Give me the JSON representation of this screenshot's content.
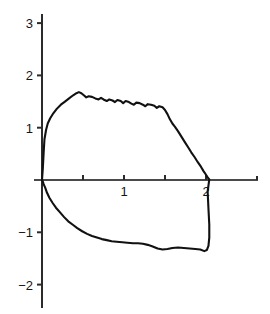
{
  "chart_data": {
    "type": "line",
    "title": "",
    "subtitle": "",
    "xlabel": "",
    "ylabel": "",
    "xlim": [
      -0.1,
      2.65
    ],
    "ylim": [
      -2.35,
      3.15
    ],
    "grid": false,
    "legend": null,
    "legend_position": "none",
    "axis_style": "crossed-axes-at-origin",
    "x_ticks": [
      0.5,
      1,
      1.5,
      2
    ],
    "x_tick_labels": [
      "",
      "1",
      "",
      "2"
    ],
    "y_ticks": [
      -2,
      -1,
      1,
      2,
      3
    ],
    "y_tick_labels": [
      "−2",
      "−1",
      "1",
      "2",
      "3"
    ],
    "annotations": [],
    "series": [
      {
        "name": "hysteresis-loop",
        "color": "#111111",
        "closed": true,
        "description": "Closed hysteresis loop: upper branch rises steeply from origin to a noisy plateau near 1.6, decays to zero near x=2; lower branch falls from origin to about -1.2, drifts to -1.35, then rises vertically at x=2.04 back to zero.",
        "points": [
          [
            0.0,
            0.0
          ],
          [
            0.01,
            0.22
          ],
          [
            0.02,
            0.52
          ],
          [
            0.03,
            0.78
          ],
          [
            0.05,
            0.96
          ],
          [
            0.07,
            1.08
          ],
          [
            0.1,
            1.18
          ],
          [
            0.14,
            1.28
          ],
          [
            0.18,
            1.36
          ],
          [
            0.23,
            1.44
          ],
          [
            0.28,
            1.5
          ],
          [
            0.33,
            1.56
          ],
          [
            0.38,
            1.62
          ],
          [
            0.42,
            1.66
          ],
          [
            0.45,
            1.68
          ],
          [
            0.48,
            1.66
          ],
          [
            0.51,
            1.62
          ],
          [
            0.54,
            1.58
          ],
          [
            0.57,
            1.6
          ],
          [
            0.61,
            1.59
          ],
          [
            0.65,
            1.56
          ],
          [
            0.69,
            1.54
          ],
          [
            0.72,
            1.57
          ],
          [
            0.75,
            1.54
          ],
          [
            0.79,
            1.51
          ],
          [
            0.82,
            1.54
          ],
          [
            0.86,
            1.52
          ],
          [
            0.89,
            1.49
          ],
          [
            0.92,
            1.53
          ],
          [
            0.96,
            1.51
          ],
          [
            0.99,
            1.47
          ],
          [
            1.02,
            1.51
          ],
          [
            1.06,
            1.49
          ],
          [
            1.09,
            1.46
          ],
          [
            1.12,
            1.44
          ],
          [
            1.15,
            1.48
          ],
          [
            1.19,
            1.47
          ],
          [
            1.23,
            1.44
          ],
          [
            1.26,
            1.41
          ],
          [
            1.29,
            1.45
          ],
          [
            1.33,
            1.44
          ],
          [
            1.37,
            1.42
          ],
          [
            1.4,
            1.38
          ],
          [
            1.43,
            1.41
          ],
          [
            1.47,
            1.39
          ],
          [
            1.5,
            1.34
          ],
          [
            1.53,
            1.26
          ],
          [
            1.56,
            1.16
          ],
          [
            1.59,
            1.08
          ],
          [
            1.62,
            1.02
          ],
          [
            1.66,
            0.93
          ],
          [
            1.7,
            0.83
          ],
          [
            1.74,
            0.73
          ],
          [
            1.78,
            0.63
          ],
          [
            1.82,
            0.53
          ],
          [
            1.86,
            0.44
          ],
          [
            1.9,
            0.34
          ],
          [
            1.94,
            0.25
          ],
          [
            1.97,
            0.17
          ],
          [
            2.0,
            0.1
          ],
          [
            2.02,
            0.05
          ],
          [
            2.04,
            0.01
          ],
          [
            2.02,
            -0.22
          ],
          [
            2.03,
            -0.55
          ],
          [
            2.04,
            -0.85
          ],
          [
            2.04,
            -1.1
          ],
          [
            2.03,
            -1.26
          ],
          [
            2.01,
            -1.34
          ],
          [
            1.98,
            -1.36
          ],
          [
            1.93,
            -1.33
          ],
          [
            1.87,
            -1.32
          ],
          [
            1.8,
            -1.31
          ],
          [
            1.73,
            -1.3
          ],
          [
            1.66,
            -1.29
          ],
          [
            1.59,
            -1.3
          ],
          [
            1.53,
            -1.32
          ],
          [
            1.47,
            -1.33
          ],
          [
            1.41,
            -1.31
          ],
          [
            1.35,
            -1.27
          ],
          [
            1.29,
            -1.24
          ],
          [
            1.23,
            -1.22
          ],
          [
            1.17,
            -1.21
          ],
          [
            1.11,
            -1.21
          ],
          [
            1.04,
            -1.2
          ],
          [
            0.98,
            -1.19
          ],
          [
            0.91,
            -1.18
          ],
          [
            0.85,
            -1.17
          ],
          [
            0.79,
            -1.15
          ],
          [
            0.73,
            -1.13
          ],
          [
            0.67,
            -1.1
          ],
          [
            0.61,
            -1.07
          ],
          [
            0.55,
            -1.03
          ],
          [
            0.49,
            -0.98
          ],
          [
            0.43,
            -0.92
          ],
          [
            0.38,
            -0.86
          ],
          [
            0.32,
            -0.79
          ],
          [
            0.27,
            -0.71
          ],
          [
            0.22,
            -0.62
          ],
          [
            0.17,
            -0.53
          ],
          [
            0.13,
            -0.44
          ],
          [
            0.09,
            -0.34
          ],
          [
            0.06,
            -0.24
          ],
          [
            0.04,
            -0.15
          ],
          [
            0.02,
            -0.08
          ],
          [
            0.01,
            -0.03
          ],
          [
            0.0,
            0.0
          ]
        ]
      }
    ]
  },
  "geometry": {
    "origin_x_px": 42,
    "origin_y_px": 180,
    "x_scale_px_per_unit": 82,
    "y_scale_px_per_unit": 52.3,
    "y_axis_top_px": 14,
    "y_axis_bottom_px": 308,
    "x_axis_right_px": 258,
    "x_axis_left_px": 34,
    "tick_len_px": 5
  },
  "colors": {
    "curve": "#111111",
    "axis": "#2b2b2b",
    "x_axis": "#4a4a4a",
    "label": "#151515",
    "background": "#ffffff"
  }
}
